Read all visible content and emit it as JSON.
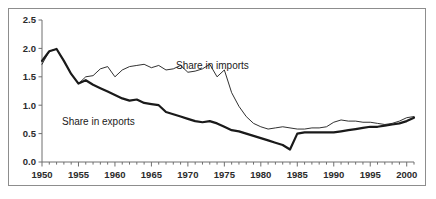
{
  "chart_data": {
    "type": "line",
    "title": "",
    "subtitle": "",
    "xlabel": "",
    "ylabel": "",
    "xlim": [
      1950,
      2001
    ],
    "ylim": [
      0.0,
      2.5
    ],
    "ytick_values": [
      0.0,
      0.5,
      1.0,
      1.5,
      2.0,
      2.5
    ],
    "ytick_labels": [
      "0.0",
      "0.5",
      "1.0",
      "1.5",
      "2.0",
      "2.5"
    ],
    "xtick_labels": [
      "1950",
      "1955",
      "1960",
      "1965",
      "1970",
      "1975",
      "1980",
      "1985",
      "1990",
      "1995",
      "2000"
    ],
    "xtick_values": [
      1950,
      1955,
      1960,
      1965,
      1970,
      1975,
      1980,
      1985,
      1990,
      1995,
      2000
    ],
    "minor_xticks_every": 1,
    "grid": false,
    "legend_position": "inline-annotations",
    "x": [
      1950,
      1951,
      1952,
      1953,
      1954,
      1955,
      1956,
      1957,
      1958,
      1959,
      1960,
      1961,
      1962,
      1963,
      1964,
      1965,
      1966,
      1967,
      1968,
      1969,
      1970,
      1971,
      1972,
      1973,
      1974,
      1975,
      1976,
      1977,
      1978,
      1979,
      1980,
      1981,
      1982,
      1983,
      1984,
      1985,
      1986,
      1987,
      1988,
      1989,
      1990,
      1991,
      1992,
      1993,
      1994,
      1995,
      1996,
      1997,
      1998,
      1999,
      2000,
      2001
    ],
    "series": [
      {
        "name": "Share in imports",
        "style": "thin",
        "annotation": "Share in imports",
        "values": [
          1.72,
          1.95,
          1.99,
          1.78,
          1.55,
          1.38,
          1.5,
          1.52,
          1.64,
          1.68,
          1.5,
          1.62,
          1.68,
          1.7,
          1.72,
          1.66,
          1.7,
          1.62,
          1.64,
          1.7,
          1.58,
          1.6,
          1.64,
          1.72,
          1.5,
          1.62,
          1.22,
          0.98,
          0.8,
          0.68,
          0.62,
          0.58,
          0.6,
          0.62,
          0.6,
          0.58,
          0.58,
          0.6,
          0.6,
          0.62,
          0.7,
          0.74,
          0.72,
          0.72,
          0.7,
          0.7,
          0.68,
          0.66,
          0.68,
          0.72,
          0.78,
          0.8
        ]
      },
      {
        "name": "Share in exports",
        "style": "thick",
        "annotation": "Share in exports",
        "values": [
          1.78,
          1.95,
          1.99,
          1.78,
          1.55,
          1.38,
          1.44,
          1.36,
          1.3,
          1.24,
          1.18,
          1.12,
          1.08,
          1.1,
          1.04,
          1.02,
          1.0,
          0.88,
          0.84,
          0.8,
          0.76,
          0.72,
          0.7,
          0.72,
          0.68,
          0.62,
          0.56,
          0.54,
          0.5,
          0.46,
          0.42,
          0.38,
          0.34,
          0.3,
          0.22,
          0.5,
          0.52,
          0.52,
          0.52,
          0.52,
          0.52,
          0.54,
          0.56,
          0.58,
          0.6,
          0.62,
          0.62,
          0.64,
          0.66,
          0.68,
          0.72,
          0.78
        ]
      }
    ]
  },
  "footer": {
    "caption": ""
  }
}
